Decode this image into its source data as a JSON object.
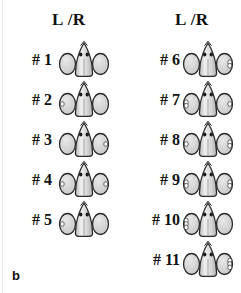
{
  "figure": {
    "panel_label": "b",
    "background_color": "#ffffff",
    "columns": [
      {
        "id": "left",
        "header": "L /R",
        "rows": [
          {
            "label": "# 1",
            "left_spots": 0,
            "right_spots": 0,
            "head_spots": 2
          },
          {
            "label": "# 2",
            "left_spots": 1,
            "right_spots": 0,
            "head_spots": 2
          },
          {
            "label": "# 3",
            "left_spots": 0,
            "right_spots": 1,
            "head_spots": 2
          },
          {
            "label": "# 4",
            "left_spots": 1,
            "right_spots": 1,
            "head_spots": 2
          },
          {
            "label": "# 5",
            "left_spots": 1,
            "right_spots": 0,
            "head_spots": 2
          }
        ]
      },
      {
        "id": "right",
        "header": "L /R",
        "rows": [
          {
            "label": "# 6",
            "left_spots": 0,
            "right_spots": 2,
            "head_spots": 2
          },
          {
            "label": "# 7",
            "left_spots": 2,
            "right_spots": 1,
            "head_spots": 2
          },
          {
            "label": "# 8",
            "left_spots": 1,
            "right_spots": 2,
            "head_spots": 2
          },
          {
            "label": "# 9",
            "left_spots": 2,
            "right_spots": 2,
            "head_spots": 2
          },
          {
            "label": "# 10",
            "left_spots": 3,
            "right_spots": 0,
            "head_spots": 2
          },
          {
            "label": "# 11",
            "left_spots": 0,
            "right_spots": 3,
            "head_spots": 2
          }
        ]
      }
    ],
    "colors": {
      "outline": "#2b2b2b",
      "lobe_fill": "#c9c9c9",
      "lobe_highlight": "#e8e8e8",
      "body_fill": "#d6d6d6",
      "body_highlight": "#f0f0f0",
      "spot_fill": "#ffffff",
      "eye_fill": "#1a1a1a",
      "text": "#111111"
    },
    "specimen_size": {
      "width": 52,
      "height": 40
    }
  }
}
